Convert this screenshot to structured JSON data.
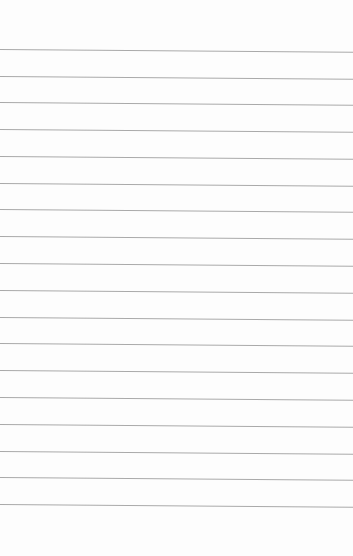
{
  "page": {
    "type": "lined-paper",
    "background_color": "#fdfdfd",
    "rule_color": "#a9a9a9",
    "rule_count": 18,
    "rule_positions_y": [
      49,
      76,
      102,
      129,
      156,
      183,
      209,
      236,
      263,
      290,
      317,
      343,
      370,
      397,
      424,
      451,
      477,
      504
    ]
  }
}
